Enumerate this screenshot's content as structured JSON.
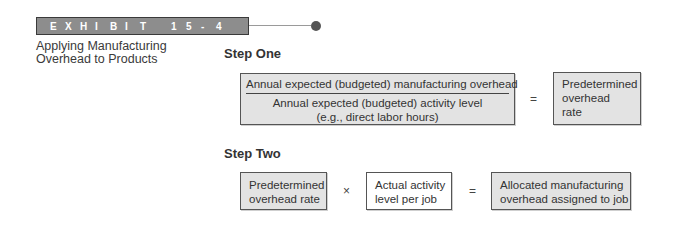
{
  "header": {
    "exhibit_chars": [
      "E",
      "X",
      "H",
      "I",
      "B",
      "I",
      "T"
    ],
    "exhibit_number_chars": [
      "1",
      "5",
      "-",
      "4"
    ],
    "subtitle_line1": "Applying Manufacturing",
    "subtitle_line2": "Overhead to Products"
  },
  "step_one": {
    "heading": "Step One",
    "numerator": "Annual expected (budgeted) manufacturing overhead",
    "denominator_line1": "Annual expected (budgeted) activity level",
    "denominator_line2": "(e.g., direct labor hours)",
    "operator": "=",
    "result_line1": "Predetermined",
    "result_line2": "overhead",
    "result_line3": "rate"
  },
  "step_two": {
    "heading": "Step Two",
    "box1_line1": "Predetermined",
    "box1_line2": "overhead rate",
    "operator1": "×",
    "box2_line1": "Actual activity",
    "box2_line2": "level per job",
    "operator2": "=",
    "box3_line1": "Allocated manufacturing",
    "box3_line2": "overhead assigned to job"
  },
  "colors": {
    "exhibit_bar": "#8d8d8d",
    "box_fill": "#e3e3e3",
    "box_border": "#555555",
    "dot": "#555555"
  }
}
